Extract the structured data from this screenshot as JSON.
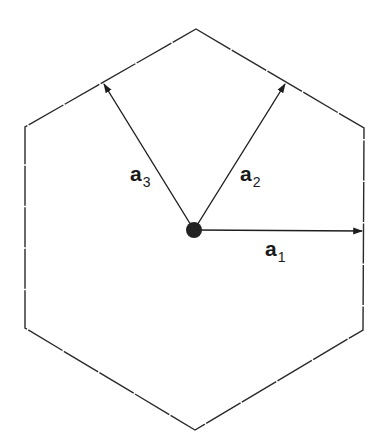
{
  "diagram": {
    "type": "hexagonal-lattice-basis-vectors",
    "colors": {
      "background": "#ffffff",
      "outline": "#2a2a2a",
      "vector": "#1e1e1e",
      "origin_dot": "#222222",
      "label": "#1a1a1a"
    },
    "hexagon": {
      "vertices": [
        [
          196,
          29
        ],
        [
          364,
          128
        ],
        [
          363,
          330
        ],
        [
          195,
          430
        ],
        [
          25,
          328
        ],
        [
          25,
          127
        ]
      ],
      "style": "thin, slightly broken line"
    },
    "origin": {
      "x": 194,
      "y": 230,
      "radius": 8
    },
    "vectors": [
      {
        "id": "a1",
        "name": "a",
        "subscript": "1",
        "tip": [
          362,
          231
        ],
        "label_pos": [
          265,
          238
        ]
      },
      {
        "id": "a2",
        "name": "a",
        "subscript": "2",
        "tip": [
          285,
          84
        ],
        "label_pos": [
          240,
          163
        ]
      },
      {
        "id": "a3",
        "name": "a",
        "subscript": "3",
        "tip": [
          104,
          84
        ],
        "label_pos": [
          130,
          163
        ]
      }
    ]
  }
}
